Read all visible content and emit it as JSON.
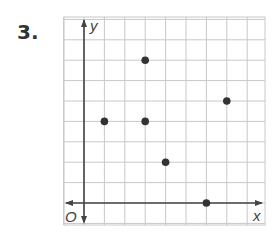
{
  "problem_number": "3.",
  "chart_data": {
    "type": "scatter",
    "title": "",
    "xlabel": "x",
    "ylabel": "y",
    "origin_label": "O",
    "grid": true,
    "xlim": [
      -1,
      9
    ],
    "ylim": [
      -1,
      9
    ],
    "points": [
      {
        "x": 1,
        "y": 4
      },
      {
        "x": 3,
        "y": 7
      },
      {
        "x": 3,
        "y": 4
      },
      {
        "x": 4,
        "y": 2
      },
      {
        "x": 6,
        "y": 0
      },
      {
        "x": 7,
        "y": 5
      }
    ]
  },
  "colors": {
    "grid": "#c8c8c8",
    "axis": "#444444",
    "point": "#333333"
  }
}
